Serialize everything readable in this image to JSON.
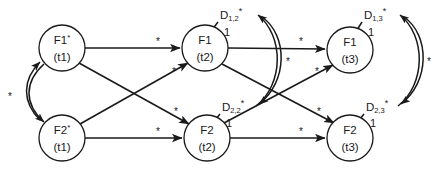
{
  "diagram": {
    "type": "directed-graph",
    "width": 440,
    "height": 176,
    "colors": {
      "stroke": "#1a1a1a",
      "node_fill": "#ffffff",
      "background": "#ffffff"
    },
    "nodes": [
      {
        "id": "F1t1",
        "name": "F1",
        "marker": "*",
        "time": "(t1)",
        "cx": 62,
        "cy": 48,
        "r": 23
      },
      {
        "id": "F1t2",
        "name": "F1",
        "marker": "",
        "time": "(t2)",
        "cx": 205,
        "cy": 48,
        "r": 23
      },
      {
        "id": "F1t3",
        "name": "F1",
        "marker": "",
        "time": "(t3)",
        "cx": 350,
        "cy": 50,
        "r": 23
      },
      {
        "id": "F2t1",
        "name": "F2",
        "marker": "*",
        "time": "(t1)",
        "cx": 62,
        "cy": 138,
        "r": 23
      },
      {
        "id": "F2t2",
        "name": "F2",
        "marker": "",
        "time": "(t2)",
        "cx": 207,
        "cy": 138,
        "r": 23
      },
      {
        "id": "F2t3",
        "name": "F2",
        "marker": "",
        "time": "(t3)",
        "cx": 350,
        "cy": 138,
        "r": 23
      }
    ],
    "disturbance_labels": [
      {
        "id": "D12",
        "base": "D",
        "sub": "1,2",
        "sup": "*",
        "x": 220,
        "y": 16
      },
      {
        "id": "D13",
        "base": "D",
        "sub": "1,3",
        "sup": "*",
        "x": 364,
        "y": 16
      },
      {
        "id": "D22",
        "base": "D",
        "sub": "2,2",
        "sup": "*",
        "x": 222,
        "y": 108
      },
      {
        "id": "D23",
        "base": "D",
        "sub": "2,3",
        "sup": "*",
        "x": 366,
        "y": 108
      }
    ],
    "weight_labels": [
      {
        "id": "w-D12",
        "text": "1",
        "x": 227,
        "y": 33
      },
      {
        "id": "w-D13",
        "text": "1",
        "x": 371,
        "y": 33
      },
      {
        "id": "w-D22",
        "text": "1",
        "x": 229,
        "y": 124
      },
      {
        "id": "w-D23",
        "text": "1",
        "x": 373,
        "y": 124
      }
    ],
    "star_labels": [
      {
        "id": "s-left-pair",
        "text": "*",
        "x": 10,
        "y": 97
      },
      {
        "id": "s-f1t1-f1t2",
        "text": "*",
        "x": 158,
        "y": 42
      },
      {
        "id": "s-f2t1-f1t2",
        "text": "*",
        "x": 174,
        "y": 72
      },
      {
        "id": "s-f1t1-f2t2",
        "text": "*",
        "x": 176,
        "y": 112
      },
      {
        "id": "s-f2t1-f2t2",
        "text": "*",
        "x": 158,
        "y": 132
      },
      {
        "id": "s-f1t2-f1t3",
        "text": "*",
        "x": 301,
        "y": 42
      },
      {
        "id": "s-d12-d22",
        "text": "*",
        "x": 288,
        "y": 62
      },
      {
        "id": "s-f2t2-f1t3",
        "text": "*",
        "x": 317,
        "y": 72
      },
      {
        "id": "s-f1t2-f2t3",
        "text": "*",
        "x": 319,
        "y": 112
      },
      {
        "id": "s-f2t2-f2t3",
        "text": "*",
        "x": 301,
        "y": 132
      },
      {
        "id": "s-d13-d23",
        "text": "*",
        "x": 429,
        "y": 62
      }
    ],
    "edges": [
      {
        "id": "e-F1t1-F1t2",
        "from": "F1t1",
        "to": "F1t2",
        "label": "*",
        "kind": "straight"
      },
      {
        "id": "e-F2t1-F2t2",
        "from": "F2t1",
        "to": "F2t2",
        "label": "*",
        "kind": "straight"
      },
      {
        "id": "e-F1t2-F1t3",
        "from": "F1t2",
        "to": "F1t3",
        "label": "*",
        "kind": "straight"
      },
      {
        "id": "e-F2t2-F2t3",
        "from": "F2t2",
        "to": "F2t3",
        "label": "*",
        "kind": "straight"
      },
      {
        "id": "e-F1t1-F2t2",
        "from": "F1t1",
        "to": "F2t2",
        "label": "*",
        "kind": "diagonal"
      },
      {
        "id": "e-F2t1-F1t2",
        "from": "F2t1",
        "to": "F1t2",
        "label": "*",
        "kind": "diagonal"
      },
      {
        "id": "e-F1t2-F2t3",
        "from": "F1t2",
        "to": "F2t3",
        "label": "*",
        "kind": "diagonal"
      },
      {
        "id": "e-F2t2-F1t3",
        "from": "F2t2",
        "to": "F1t3",
        "label": "*",
        "kind": "diagonal"
      },
      {
        "id": "e-D12-F1t2",
        "from": "D12",
        "to": "F1t2",
        "label": "1",
        "kind": "short"
      },
      {
        "id": "e-D13-F1t3",
        "from": "D13",
        "to": "F1t3",
        "label": "1",
        "kind": "short"
      },
      {
        "id": "e-D22-F2t2",
        "from": "D22",
        "to": "F2t2",
        "label": "1",
        "kind": "short"
      },
      {
        "id": "e-D23-F2t3",
        "from": "D23",
        "to": "F2t3",
        "label": "1",
        "kind": "short"
      },
      {
        "id": "e-F1t1-F2t1",
        "from": "F1t1",
        "to": "F2t1",
        "label": "*",
        "kind": "bidirectional-curve"
      },
      {
        "id": "e-D12-D22",
        "from": "D12",
        "to": "D22",
        "label": "*",
        "kind": "bidirectional-curve"
      },
      {
        "id": "e-D13-D23",
        "from": "D13",
        "to": "D23",
        "label": "*",
        "kind": "bidirectional-curve"
      }
    ]
  }
}
